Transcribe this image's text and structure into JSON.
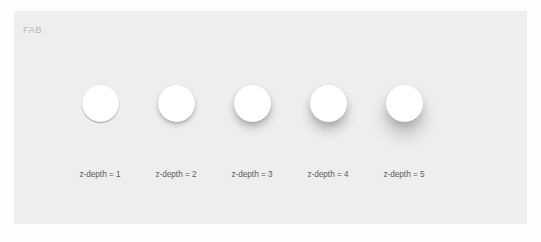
{
  "canvas": {
    "background_color": "#fdfdfd",
    "width": 541,
    "height": 242
  },
  "panel": {
    "title": "FAB",
    "title_color": "#b9b9b9",
    "background_color": "#eeeeee"
  },
  "fabs": {
    "surface_color": "#ffffff",
    "label_color": "#5a5a5a",
    "items": [
      {
        "label": "z-depth = 1",
        "z_depth": 1
      },
      {
        "label": "z-depth = 2",
        "z_depth": 2
      },
      {
        "label": "z-depth = 3",
        "z_depth": 3
      },
      {
        "label": "z-depth = 4",
        "z_depth": 4
      },
      {
        "label": "z-depth = 5",
        "z_depth": 5
      }
    ]
  }
}
